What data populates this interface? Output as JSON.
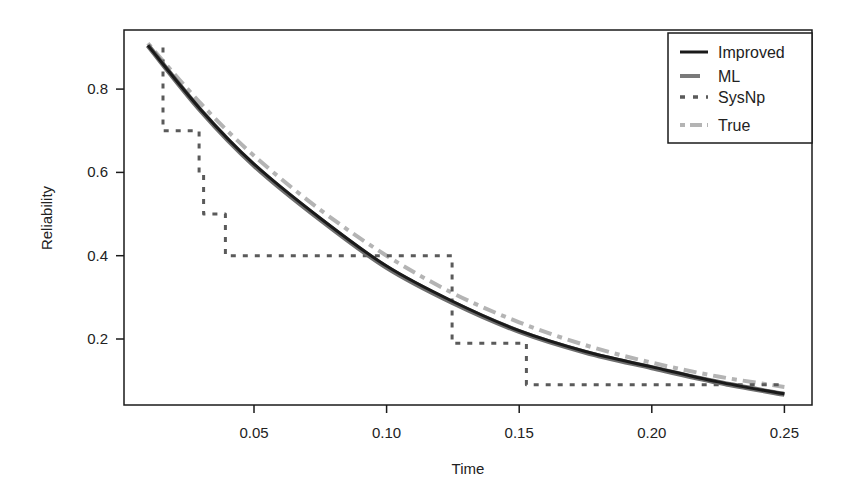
{
  "chart_data": {
    "type": "line",
    "title": "",
    "xlabel": "Time",
    "ylabel": "Reliability",
    "xlim": [
      0.0,
      0.26
    ],
    "ylim": [
      0.04,
      0.94
    ],
    "xticks": [
      0.05,
      0.1,
      0.15,
      0.2,
      0.25
    ],
    "xtick_labels": [
      "0.05",
      "0.10",
      "0.15",
      "0.20",
      "0.25"
    ],
    "yticks": [
      0.2,
      0.4,
      0.6,
      0.8
    ],
    "ytick_labels": [
      "0.2",
      "0.4",
      "0.6",
      "0.8"
    ],
    "grid": false,
    "legend_position": "top-right",
    "series": [
      {
        "name": "Improved",
        "style": "solid",
        "color": "#1a1a1a",
        "width": 3,
        "x": [
          0.01,
          0.03,
          0.05,
          0.075,
          0.1,
          0.125,
          0.15,
          0.175,
          0.2,
          0.225,
          0.25
        ],
        "y": [
          0.905,
          0.75,
          0.62,
          0.49,
          0.375,
          0.29,
          0.22,
          0.17,
          0.133,
          0.097,
          0.068
        ]
      },
      {
        "name": "ML",
        "style": "solid",
        "color": "#6e6e6e",
        "width": 5,
        "x": [
          0.01,
          0.03,
          0.05,
          0.075,
          0.1,
          0.125,
          0.15,
          0.175,
          0.2,
          0.225,
          0.25
        ],
        "y": [
          0.905,
          0.748,
          0.617,
          0.487,
          0.372,
          0.287,
          0.218,
          0.168,
          0.131,
          0.096,
          0.067
        ]
      },
      {
        "name": "SysNp",
        "style": "dotted",
        "color": "#5a5a5a",
        "width": 3,
        "step": true,
        "x": [
          0.0157,
          0.0157,
          0.0293,
          0.0293,
          0.031,
          0.031,
          0.0392,
          0.0392,
          0.1247,
          0.1247,
          0.1527,
          0.1527,
          0.25
        ],
        "y": [
          0.9,
          0.7,
          0.7,
          0.6,
          0.6,
          0.5,
          0.5,
          0.4,
          0.4,
          0.19,
          0.19,
          0.09,
          0.09
        ]
      },
      {
        "name": "True",
        "style": "dashdot",
        "color": "#b4b4b4",
        "width": 4,
        "x": [
          0.01,
          0.03,
          0.05,
          0.075,
          0.1,
          0.125,
          0.15,
          0.175,
          0.2,
          0.225,
          0.25
        ],
        "y": [
          0.91,
          0.765,
          0.64,
          0.51,
          0.4,
          0.31,
          0.24,
          0.185,
          0.143,
          0.11,
          0.085
        ]
      }
    ]
  },
  "legend": {
    "items": [
      {
        "label": "Improved"
      },
      {
        "label": "ML"
      },
      {
        "label": "SysNp"
      },
      {
        "label": "True"
      }
    ]
  },
  "axes": {
    "xlabel": "Time",
    "ylabel": "Reliability"
  }
}
